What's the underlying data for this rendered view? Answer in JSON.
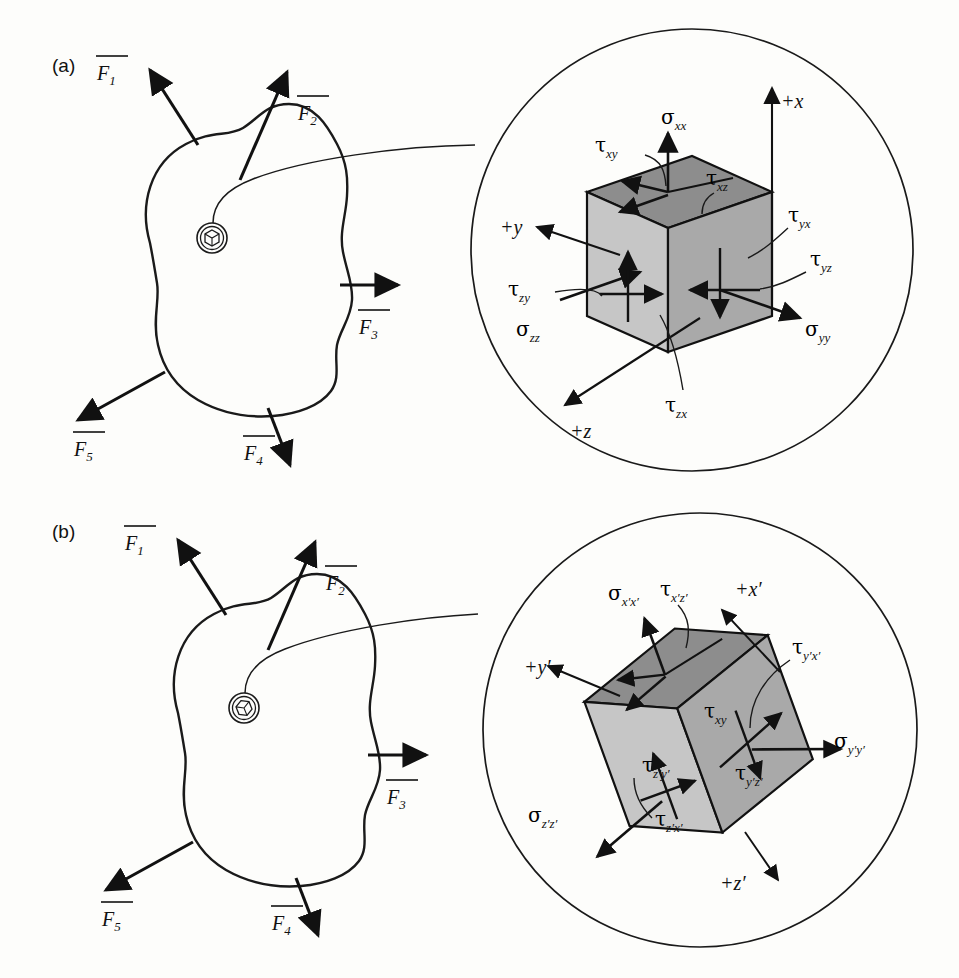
{
  "figure": {
    "background": "#fdfdfb",
    "ink": "#1a1a1a",
    "width": 959,
    "height": 978,
    "face_colors": {
      "top_dark": "#8d8d8d",
      "left_light": "#c6c6c6",
      "right_mid": "#a9a9a9"
    }
  },
  "panels": [
    {
      "id": "a",
      "label": "(a)",
      "body": {
        "name": "irregular-body-outline",
        "callout_marker": "cube-in-circle-icon"
      },
      "forces": [
        {
          "name": "F1",
          "symbol": "F",
          "subscript": "1",
          "overbar": true
        },
        {
          "name": "F2",
          "symbol": "F",
          "subscript": "2",
          "overbar": true
        },
        {
          "name": "F3",
          "symbol": "F",
          "subscript": "3",
          "overbar": true
        },
        {
          "name": "F4",
          "symbol": "F",
          "subscript": "4",
          "overbar": true
        },
        {
          "name": "F5",
          "symbol": "F",
          "subscript": "5",
          "overbar": true
        }
      ],
      "axes": [
        {
          "name": "axis-plus-x",
          "label": "+x"
        },
        {
          "name": "axis-plus-y",
          "label": "+y"
        },
        {
          "name": "axis-plus-z",
          "label": "+z"
        }
      ],
      "normal_stresses": [
        {
          "name": "sigma-xx",
          "symbol": "σ",
          "subscript": "xx"
        },
        {
          "name": "sigma-yy",
          "symbol": "σ",
          "subscript": "yy"
        },
        {
          "name": "sigma-zz",
          "symbol": "σ",
          "subscript": "zz"
        }
      ],
      "shear_stresses": [
        {
          "name": "tau-xy",
          "symbol": "τ",
          "subscript": "xy"
        },
        {
          "name": "tau-xz",
          "symbol": "τ",
          "subscript": "xz"
        },
        {
          "name": "tau-yx",
          "symbol": "τ",
          "subscript": "yx"
        },
        {
          "name": "tau-yz",
          "symbol": "τ",
          "subscript": "yz"
        },
        {
          "name": "tau-zy",
          "symbol": "τ",
          "subscript": "zy"
        },
        {
          "name": "tau-zx",
          "symbol": "τ",
          "subscript": "zx"
        }
      ]
    },
    {
      "id": "b",
      "label": "(b)",
      "body": {
        "name": "irregular-body-outline",
        "callout_marker": "rotated-cube-in-circle-icon"
      },
      "forces": [
        {
          "name": "F1",
          "symbol": "F",
          "subscript": "1",
          "overbar": true
        },
        {
          "name": "F2",
          "symbol": "F",
          "subscript": "2",
          "overbar": true
        },
        {
          "name": "F3",
          "symbol": "F",
          "subscript": "3",
          "overbar": true
        },
        {
          "name": "F4",
          "symbol": "F",
          "subscript": "4",
          "overbar": true
        },
        {
          "name": "F5",
          "symbol": "F",
          "subscript": "5",
          "overbar": true
        }
      ],
      "axes": [
        {
          "name": "axis-plus-x-prime",
          "label": "+x′"
        },
        {
          "name": "axis-plus-y-prime",
          "label": "+y′"
        },
        {
          "name": "axis-plus-z-prime",
          "label": "+z′"
        }
      ],
      "normal_stresses": [
        {
          "name": "sigma-xpxp",
          "symbol": "σ",
          "subscript": "x′x′"
        },
        {
          "name": "sigma-ypyp",
          "symbol": "σ",
          "subscript": "y′y′"
        },
        {
          "name": "sigma-zpzp",
          "symbol": "σ",
          "subscript": "z′z′"
        }
      ],
      "shear_stresses": [
        {
          "name": "tau-xy",
          "symbol": "τ",
          "subscript": "xy"
        },
        {
          "name": "tau-xpzp",
          "symbol": "τ",
          "subscript": "x′z′"
        },
        {
          "name": "tau-ypxp",
          "symbol": "τ",
          "subscript": "y′x′"
        },
        {
          "name": "tau-ypzp",
          "symbol": "τ",
          "subscript": "y′z′"
        },
        {
          "name": "tau-zpyp",
          "symbol": "τ",
          "subscript": "z′y′"
        },
        {
          "name": "tau-zpxp",
          "symbol": "τ",
          "subscript": "z′x′"
        }
      ]
    }
  ]
}
